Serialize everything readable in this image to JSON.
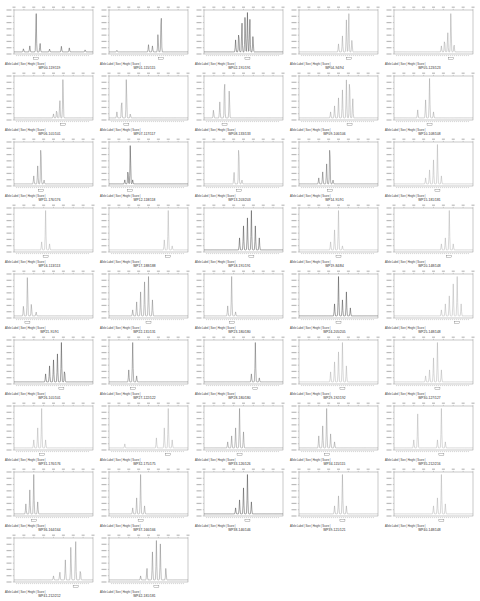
{
  "figure": {
    "meta_caption": "Allele Label | Size | Height | Score |"
  },
  "chart_data": [
    {
      "type": "line",
      "label": "WP00-119/119",
      "color": "#444444",
      "peaks": [
        [
          0.12,
          0.08
        ],
        [
          0.2,
          0.15
        ],
        [
          0.28,
          1.0
        ],
        [
          0.33,
          0.22
        ],
        [
          0.45,
          0.07
        ],
        [
          0.6,
          0.14
        ],
        [
          0.7,
          0.1
        ],
        [
          0.9,
          0.05
        ]
      ]
    },
    {
      "type": "line",
      "label": "WP01-115/115",
      "color": "#555555",
      "peaks": [
        [
          0.1,
          0.04
        ],
        [
          0.5,
          0.18
        ],
        [
          0.55,
          0.15
        ],
        [
          0.62,
          0.45
        ],
        [
          0.66,
          1.0
        ]
      ]
    },
    {
      "type": "line",
      "label": "WP02-191/191",
      "color": "#333333",
      "peaks": [
        [
          0.4,
          0.3
        ],
        [
          0.44,
          0.5
        ],
        [
          0.48,
          0.75
        ],
        [
          0.52,
          0.9
        ],
        [
          0.55,
          1.0
        ],
        [
          0.58,
          0.85
        ],
        [
          0.62,
          0.4
        ]
      ]
    },
    {
      "type": "line",
      "label": "WP04-94/94",
      "color": "#999999",
      "peaks": [
        [
          0.5,
          0.2
        ],
        [
          0.55,
          0.4
        ],
        [
          0.6,
          0.8
        ],
        [
          0.63,
          1.0
        ],
        [
          0.67,
          0.3
        ]
      ]
    },
    {
      "type": "line",
      "label": "WP05-123/123",
      "color": "#999999",
      "peaks": [
        [
          0.6,
          0.15
        ],
        [
          0.64,
          0.3
        ],
        [
          0.68,
          0.5
        ],
        [
          0.72,
          1.0
        ],
        [
          0.76,
          0.2
        ]
      ]
    },
    {
      "type": "line",
      "label": "WP06-101/101",
      "color": "#888888",
      "peaks": [
        [
          0.5,
          0.1
        ],
        [
          0.54,
          0.2
        ],
        [
          0.58,
          0.45
        ],
        [
          0.62,
          1.0
        ]
      ]
    },
    {
      "type": "line",
      "label": "WP07-117/117",
      "color": "#888888",
      "peaks": [
        [
          0.1,
          0.15
        ],
        [
          0.16,
          0.45
        ],
        [
          0.22,
          1.0
        ],
        [
          0.27,
          0.1
        ]
      ]
    },
    {
      "type": "line",
      "label": "WP08-133/133",
      "color": "#888888",
      "peaks": [
        [
          0.12,
          0.2
        ],
        [
          0.2,
          0.4
        ],
        [
          0.26,
          1.0
        ],
        [
          0.32,
          0.7
        ]
      ]
    },
    {
      "type": "line",
      "label": "WP09-106/106",
      "color": "#999999",
      "peaks": [
        [
          0.4,
          0.15
        ],
        [
          0.45,
          0.3
        ],
        [
          0.5,
          0.5
        ],
        [
          0.55,
          0.7
        ],
        [
          0.6,
          0.95
        ],
        [
          0.64,
          1.0
        ],
        [
          0.68,
          0.5
        ]
      ]
    },
    {
      "type": "line",
      "label": "WP10-108/108",
      "color": "#999999",
      "peaks": [
        [
          0.3,
          0.2
        ],
        [
          0.4,
          0.45
        ],
        [
          0.45,
          1.0
        ],
        [
          0.5,
          0.15
        ]
      ]
    },
    {
      "type": "line",
      "label": "WP11-176/176",
      "color": "#777777",
      "peaks": [
        [
          0.25,
          0.2
        ],
        [
          0.3,
          0.45
        ],
        [
          0.34,
          1.0
        ],
        [
          0.38,
          0.1
        ]
      ]
    },
    {
      "type": "line",
      "label": "WP12-118/118",
      "color": "#333333",
      "peaks": [
        [
          0.2,
          0.1
        ],
        [
          0.24,
          0.35
        ],
        [
          0.27,
          1.0
        ],
        [
          0.3,
          0.1
        ]
      ]
    },
    {
      "type": "line",
      "label": "WP13-203/203",
      "color": "#999999",
      "peaks": [
        [
          0.38,
          0.3
        ],
        [
          0.44,
          1.0
        ],
        [
          0.48,
          0.1
        ]
      ]
    },
    {
      "type": "line",
      "label": "WP14-91/91",
      "color": "#555555",
      "peaks": [
        [
          0.25,
          0.15
        ],
        [
          0.3,
          0.3
        ],
        [
          0.35,
          0.5
        ],
        [
          0.39,
          1.0
        ],
        [
          0.43,
          0.1
        ]
      ]
    },
    {
      "type": "line",
      "label": "WP15-181/181",
      "color": "#aaaaaa",
      "peaks": [
        [
          0.4,
          0.15
        ],
        [
          0.45,
          0.35
        ],
        [
          0.5,
          0.6
        ],
        [
          0.55,
          1.0
        ],
        [
          0.6,
          0.2
        ]
      ]
    },
    {
      "type": "line",
      "label": "WP16-113/113",
      "color": "#aaaaaa",
      "peaks": [
        [
          0.35,
          0.2
        ],
        [
          0.4,
          1.0
        ],
        [
          0.45,
          0.15
        ]
      ]
    },
    {
      "type": "line",
      "label": "WP17-188/188",
      "color": "#aaaaaa",
      "peaks": [
        [
          0.7,
          0.25
        ],
        [
          0.75,
          1.0
        ],
        [
          0.8,
          0.1
        ]
      ]
    },
    {
      "type": "line",
      "label": "WP18-191/191",
      "color": "#333333",
      "peaks": [
        [
          0.45,
          0.3
        ],
        [
          0.5,
          0.6
        ],
        [
          0.55,
          0.8
        ],
        [
          0.6,
          1.0
        ],
        [
          0.65,
          0.6
        ],
        [
          0.7,
          0.3
        ]
      ]
    },
    {
      "type": "line",
      "label": "WP19-84/84",
      "color": "#aaaaaa",
      "peaks": [
        [
          0.4,
          0.2
        ],
        [
          0.45,
          0.5
        ],
        [
          0.5,
          1.0
        ],
        [
          0.55,
          0.1
        ]
      ]
    },
    {
      "type": "line",
      "label": "WP20-148/148",
      "color": "#aaaaaa",
      "peaks": [
        [
          0.6,
          0.15
        ],
        [
          0.65,
          0.3
        ],
        [
          0.7,
          1.0
        ],
        [
          0.75,
          0.15
        ]
      ]
    },
    {
      "type": "line",
      "label": "WP21-91/91",
      "color": "#888888",
      "peaks": [
        [
          0.12,
          0.25
        ],
        [
          0.17,
          1.0
        ],
        [
          0.22,
          0.3
        ],
        [
          0.28,
          0.1
        ]
      ]
    },
    {
      "type": "line",
      "label": "WP22-131/131",
      "color": "#777777",
      "peaks": [
        [
          0.3,
          0.15
        ],
        [
          0.35,
          0.35
        ],
        [
          0.4,
          0.6
        ],
        [
          0.45,
          0.85
        ],
        [
          0.5,
          1.0
        ],
        [
          0.55,
          0.4
        ]
      ]
    },
    {
      "type": "line",
      "label": "WP23-180/180",
      "color": "#888888",
      "peaks": [
        [
          0.3,
          0.25
        ],
        [
          0.35,
          1.0
        ],
        [
          0.4,
          0.1
        ]
      ]
    },
    {
      "type": "line",
      "label": "WP24-205/205",
      "color": "#333333",
      "peaks": [
        [
          0.45,
          0.3
        ],
        [
          0.5,
          1.0
        ],
        [
          0.55,
          0.4
        ],
        [
          0.6,
          0.6
        ],
        [
          0.65,
          0.2
        ]
      ]
    },
    {
      "type": "line",
      "label": "WP25-148/148",
      "color": "#aaaaaa",
      "peaks": [
        [
          0.6,
          0.15
        ],
        [
          0.65,
          0.3
        ],
        [
          0.7,
          0.5
        ],
        [
          0.75,
          0.8
        ],
        [
          0.8,
          1.0
        ],
        [
          0.85,
          0.3
        ]
      ]
    },
    {
      "type": "line",
      "label": "WP26-101/101",
      "color": "#333333",
      "peaks": [
        [
          0.4,
          0.2
        ],
        [
          0.45,
          0.4
        ],
        [
          0.5,
          0.55
        ],
        [
          0.55,
          0.7
        ],
        [
          0.6,
          1.0
        ],
        [
          0.64,
          0.3
        ]
      ]
    },
    {
      "type": "line",
      "label": "WP27-122/122",
      "color": "#555555",
      "peaks": [
        [
          0.25,
          0.3
        ],
        [
          0.3,
          1.0
        ],
        [
          0.35,
          0.15
        ]
      ]
    },
    {
      "type": "line",
      "label": "WP28-180/180",
      "color": "#555555",
      "peaks": [
        [
          0.6,
          0.2
        ],
        [
          0.65,
          1.0
        ],
        [
          0.7,
          0.1
        ]
      ]
    },
    {
      "type": "line",
      "label": "WP29-192/192",
      "color": "#aaaaaa",
      "peaks": [
        [
          0.4,
          0.25
        ],
        [
          0.45,
          0.5
        ],
        [
          0.5,
          0.75
        ],
        [
          0.55,
          1.0
        ],
        [
          0.6,
          0.4
        ]
      ]
    },
    {
      "type": "line",
      "label": "WP30-127/127",
      "color": "#aaaaaa",
      "peaks": [
        [
          0.4,
          0.15
        ],
        [
          0.45,
          0.3
        ],
        [
          0.5,
          0.6
        ],
        [
          0.55,
          1.0
        ],
        [
          0.6,
          0.3
        ]
      ]
    },
    {
      "type": "line",
      "label": "WP31-176/176",
      "color": "#aaaaaa",
      "peaks": [
        [
          0.25,
          0.2
        ],
        [
          0.3,
          0.5
        ],
        [
          0.35,
          1.0
        ],
        [
          0.4,
          0.2
        ]
      ]
    },
    {
      "type": "line",
      "label": "WP32-175/175",
      "color": "#aaaaaa",
      "peaks": [
        [
          0.2,
          0.1
        ],
        [
          0.6,
          0.25
        ],
        [
          0.7,
          0.5
        ],
        [
          0.75,
          1.0
        ],
        [
          0.8,
          0.2
        ]
      ]
    },
    {
      "type": "line",
      "label": "WP33-126/126",
      "color": "#777777",
      "peaks": [
        [
          0.3,
          0.15
        ],
        [
          0.35,
          0.3
        ],
        [
          0.4,
          0.5
        ],
        [
          0.45,
          1.0
        ],
        [
          0.5,
          0.4
        ]
      ]
    },
    {
      "type": "line",
      "label": "WP34-115/115",
      "color": "#888888",
      "peaks": [
        [
          0.25,
          0.3
        ],
        [
          0.3,
          0.55
        ],
        [
          0.35,
          1.0
        ],
        [
          0.4,
          0.35
        ],
        [
          0.45,
          0.15
        ]
      ]
    },
    {
      "type": "line",
      "label": "WP35-212/216",
      "color": "#aaaaaa",
      "peaks": [
        [
          0.25,
          0.2
        ],
        [
          0.3,
          0.85
        ],
        [
          0.55,
          0.2
        ],
        [
          0.6,
          1.0
        ],
        [
          0.65,
          0.15
        ]
      ]
    },
    {
      "type": "line",
      "label": "WP36-164/164",
      "color": "#777777",
      "peaks": [
        [
          0.15,
          0.25
        ],
        [
          0.2,
          0.6
        ],
        [
          0.25,
          1.0
        ],
        [
          0.3,
          0.3
        ]
      ]
    },
    {
      "type": "line",
      "label": "WP37-166/166",
      "color": "#888888",
      "peaks": [
        [
          0.3,
          0.15
        ],
        [
          0.35,
          0.4
        ],
        [
          0.4,
          1.0
        ],
        [
          0.45,
          0.2
        ]
      ]
    },
    {
      "type": "line",
      "label": "WP38-146/146",
      "color": "#333333",
      "peaks": [
        [
          0.4,
          0.15
        ],
        [
          0.45,
          0.35
        ],
        [
          0.5,
          0.65
        ],
        [
          0.55,
          1.0
        ],
        [
          0.6,
          0.3
        ]
      ]
    },
    {
      "type": "line",
      "label": "WP39-121/121",
      "color": "#999999",
      "peaks": [
        [
          0.45,
          0.2
        ],
        [
          0.5,
          0.45
        ],
        [
          0.55,
          1.0
        ],
        [
          0.6,
          0.2
        ]
      ]
    },
    {
      "type": "line",
      "label": "WP40-148/148",
      "color": "#aaaaaa",
      "peaks": [
        [
          0.5,
          0.2
        ],
        [
          0.55,
          0.4
        ],
        [
          0.6,
          1.0
        ],
        [
          0.65,
          0.25
        ]
      ]
    },
    {
      "type": "line",
      "label": "WP41-212/212",
      "color": "#888888",
      "peaks": [
        [
          0.5,
          0.1
        ],
        [
          0.58,
          0.2
        ],
        [
          0.65,
          0.5
        ],
        [
          0.72,
          0.85
        ],
        [
          0.78,
          1.0
        ],
        [
          0.84,
          0.25
        ]
      ]
    },
    {
      "type": "line",
      "label": "WP42-181/181",
      "color": "#777777",
      "peaks": [
        [
          0.4,
          0.1
        ],
        [
          0.48,
          0.3
        ],
        [
          0.55,
          0.7
        ],
        [
          0.6,
          1.0
        ],
        [
          0.65,
          0.9
        ],
        [
          0.72,
          0.3
        ]
      ]
    }
  ]
}
